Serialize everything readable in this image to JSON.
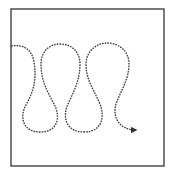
{
  "diagram": {
    "frame": {
      "stroke_color": "#333333",
      "fill_color": "#ffffff"
    },
    "path": {
      "style": "dashed",
      "stroke_color": "#333333",
      "loops": 5,
      "end_marker": "arrowhead",
      "direction": "left-to-right"
    }
  }
}
